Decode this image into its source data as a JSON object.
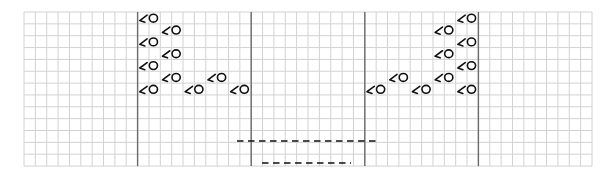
{
  "diagram": {
    "type": "knitting-chart",
    "grid": {
      "x0": 24,
      "y0": 12,
      "cols": 50,
      "rows": 13,
      "cell_w": 11.36,
      "cell_h": 11.85,
      "grid_color": "#d2d2d2",
      "border_color": "#c8c8c8"
    },
    "symbol_rows": 7,
    "symbol_row_start": 6,
    "dividers": {
      "color": "#6a6a6a",
      "cols": [
        10,
        20,
        30,
        40
      ]
    },
    "symbol": {
      "name": "left-twist-yarnover",
      "glyph": "⅄O",
      "color": "#111111"
    },
    "symbols": [
      {
        "row": 0,
        "col": 10
      },
      {
        "row": 0,
        "col": 38
      },
      {
        "row": 1,
        "col": 12
      },
      {
        "row": 1,
        "col": 36
      },
      {
        "row": 2,
        "col": 10
      },
      {
        "row": 2,
        "col": 38
      },
      {
        "row": 3,
        "col": 12
      },
      {
        "row": 3,
        "col": 36
      },
      {
        "row": 4,
        "col": 10
      },
      {
        "row": 4,
        "col": 38
      },
      {
        "row": 5,
        "col": 12
      },
      {
        "row": 5,
        "col": 16
      },
      {
        "row": 5,
        "col": 32
      },
      {
        "row": 5,
        "col": 36
      },
      {
        "row": 6,
        "col": 10
      },
      {
        "row": 6,
        "col": 14
      },
      {
        "row": 6,
        "col": 18
      },
      {
        "row": 6,
        "col": 30
      },
      {
        "row": 6,
        "col": 34
      },
      {
        "row": 6,
        "col": 38
      }
    ],
    "dashed_lines": [
      {
        "name": "dashed-line-upper",
        "x1": 237,
        "x2": 376,
        "y": 141
      },
      {
        "name": "dashed-line-lower",
        "x1": 262,
        "x2": 351,
        "y": 163
      }
    ]
  }
}
